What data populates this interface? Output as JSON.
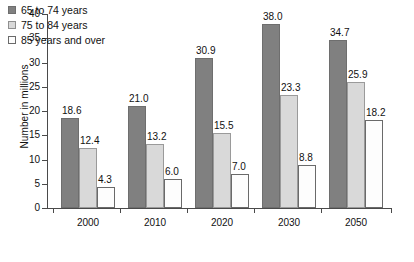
{
  "chart_data": {
    "type": "bar",
    "title": "",
    "xlabel": "",
    "ylabel": "Number in millions",
    "ylim": [
      0,
      40
    ],
    "yticks": [
      0,
      5,
      10,
      15,
      20,
      25,
      30,
      35,
      40
    ],
    "grid": false,
    "legend_position": "top-left inside plot",
    "categories": [
      "2000",
      "2010",
      "2020",
      "2030",
      "2050"
    ],
    "series": [
      {
        "name": "65 to 74 years",
        "color": "#808080",
        "values": [
          18.6,
          21.0,
          30.9,
          38.0,
          34.7
        ],
        "labels": [
          "18.6",
          "21.0",
          "30.9",
          "38.0",
          "34.7"
        ]
      },
      {
        "name": "75 to 84 years",
        "color": "#d9d9d9",
        "values": [
          12.4,
          13.2,
          15.5,
          23.3,
          25.9
        ],
        "labels": [
          "12.4",
          "13.2",
          "15.5",
          "23.3",
          "25.9"
        ]
      },
      {
        "name": "85 years and over",
        "color": "#fdfdfd",
        "values": [
          4.3,
          6.0,
          7.0,
          8.8,
          18.2
        ],
        "labels": [
          "4.3",
          "6.0",
          "7.0",
          "8.8",
          "18.2"
        ]
      }
    ]
  }
}
